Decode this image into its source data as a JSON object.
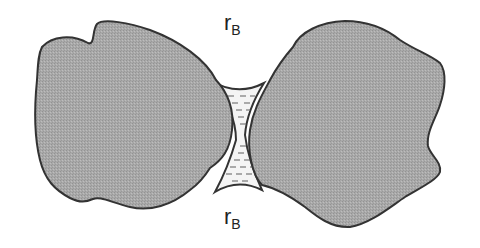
{
  "diagram": {
    "labels": {
      "top": {
        "symbol": "r",
        "subscript": "B"
      },
      "bottom": {
        "symbol": "r",
        "subscript": "B"
      }
    },
    "elements": {
      "left_grain": "solid particle",
      "right_grain": "solid particle",
      "bridge": "liquid bridge (meniscus)"
    },
    "colors": {
      "grain_fill": "#a9a9a9",
      "grain_stroke": "#333333",
      "liquid_fill": "#f4f4f4",
      "liquid_dash": "#777777",
      "background": "#ffffff"
    }
  }
}
